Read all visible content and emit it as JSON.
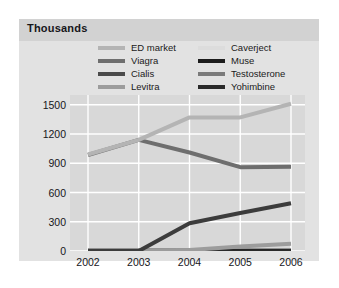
{
  "title": "Thousands",
  "legend": {
    "left_column": [
      {
        "label": "ED market",
        "color": "#b4b4b4"
      },
      {
        "label": "Viagra",
        "color": "#6e6e6e"
      },
      {
        "label": "Cialis",
        "color": "#4a4a4a"
      },
      {
        "label": "Levitra",
        "color": "#9c9c9c"
      }
    ],
    "right_column": [
      {
        "label": "Caverject",
        "color": "#dcdcdc"
      },
      {
        "label": "Muse",
        "color": "#1c1c1c"
      },
      {
        "label": "Testosterone",
        "color": "#7a7a7a"
      },
      {
        "label": "Yohimbine",
        "color": "#2a2a2a"
      }
    ]
  },
  "chart_data": {
    "type": "line",
    "title": "Thousands",
    "xlabel": "",
    "ylabel": "Thousands",
    "categories": [
      "2002",
      "2003",
      "2004",
      "2005",
      "2006"
    ],
    "x": [
      2002,
      2003,
      2004,
      2005,
      2006
    ],
    "ylim": [
      0,
      1600
    ],
    "yticks": [
      0,
      300,
      600,
      900,
      1200,
      1500
    ],
    "ytick_labels": [
      "0",
      "300",
      "600",
      "900",
      "1200",
      "1500"
    ],
    "grid": true,
    "legend_position": "top",
    "series": [
      {
        "name": "ED market",
        "color": "#b4b4b4",
        "width": 4,
        "values": [
          990,
          1140,
          1370,
          1370,
          1510
        ]
      },
      {
        "name": "Viagra",
        "color": "#6e6e6e",
        "width": 4,
        "values": [
          985,
          1140,
          1010,
          860,
          865
        ]
      },
      {
        "name": "Cialis",
        "color": "#3c3c3c",
        "width": 4,
        "values": [
          0,
          0,
          285,
          390,
          490
        ]
      },
      {
        "name": "Levitra",
        "color": "#9c9c9c",
        "width": 4,
        "values": [
          0,
          0,
          10,
          45,
          75
        ]
      },
      {
        "name": "Caverject",
        "color": "#dcdcdc",
        "width": 3,
        "values": [
          8,
          8,
          8,
          8,
          8
        ]
      },
      {
        "name": "Muse",
        "color": "#1c1c1c",
        "width": 3,
        "values": [
          5,
          5,
          5,
          5,
          5
        ]
      },
      {
        "name": "Testosterone",
        "color": "#7a7a7a",
        "width": 3,
        "values": [
          12,
          12,
          12,
          12,
          12
        ]
      },
      {
        "name": "Yohimbine",
        "color": "#2a2a2a",
        "width": 3,
        "values": [
          2,
          2,
          2,
          2,
          2
        ]
      }
    ]
  }
}
